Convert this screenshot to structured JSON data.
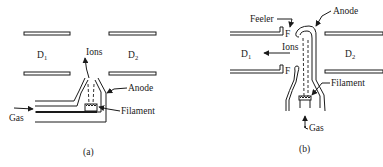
{
  "figure": {
    "panel_a": {
      "caption": "(a)",
      "labels": {
        "dee_left": "D",
        "dee_left_sub": "1",
        "dee_right": "D",
        "dee_right_sub": "2",
        "ions": "Ions",
        "anode": "Anode",
        "filament": "Filament",
        "gas": "Gas"
      }
    },
    "panel_b": {
      "caption": "(b)",
      "labels": {
        "feeler": "Feeler",
        "anode": "Anode",
        "feeler_top_mark": "F",
        "feeler_bottom_mark": "F",
        "ions": "Ions",
        "dee_left": "D",
        "dee_left_sub": "1",
        "dee_right": "D",
        "dee_right_sub": "2",
        "filament": "Filament",
        "gas": "Gas"
      }
    },
    "colors": {
      "ink": "#1a1a1a",
      "background": "#ffffff"
    }
  }
}
